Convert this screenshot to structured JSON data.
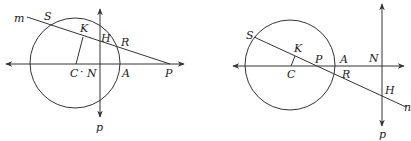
{
  "figures": [
    {
      "id": "left",
      "labels": {
        "m": "m",
        "S": "S",
        "K": "K",
        "H": "H",
        "R": "R",
        "C": "C",
        "dot": "·",
        "N": "N",
        "A": "A",
        "P": "P",
        "p": "p"
      }
    },
    {
      "id": "right",
      "labels": {
        "S": "S",
        "K": "K",
        "C": "C",
        "P": "P",
        "A": "A",
        "R": "R",
        "N": "N",
        "H": "H",
        "n": "n",
        "p": "p"
      }
    }
  ],
  "colors": {
    "stroke": "#333333",
    "text": "#222222",
    "background": "#ffffff"
  }
}
